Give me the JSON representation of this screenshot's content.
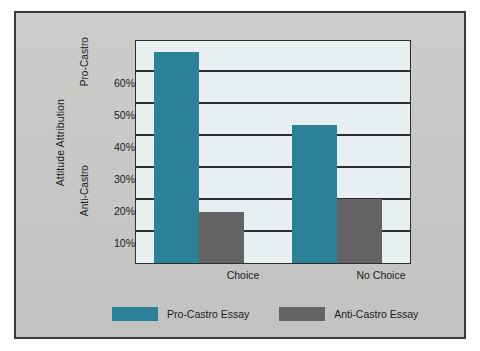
{
  "figure": {
    "background_color": "#c9c9c7",
    "border_color": "#3a3a3a"
  },
  "chart_data": {
    "type": "bar",
    "title": "",
    "subtitle": "",
    "xlabel": "",
    "ylabel": "Attitude Attribution",
    "categories": [
      "Choice",
      "No Choice"
    ],
    "series": [
      {
        "name": "Pro-Castro Essay",
        "color": "#2a8198",
        "values": [
          66,
          43
        ]
      },
      {
        "name": "Anti-Castro Essay",
        "color": "#636363",
        "values": [
          16,
          20
        ]
      }
    ],
    "ylim": [
      0,
      70
    ],
    "ytick_values": [
      10,
      20,
      30,
      40,
      50,
      60
    ],
    "ytick_labels": [
      "10%",
      "20%",
      "30%",
      "40%",
      "50%",
      "60%"
    ],
    "gridlines": [
      0,
      10,
      20,
      30,
      40,
      50,
      60,
      70
    ],
    "grid": true,
    "grid_color": "#2e2e2e",
    "plot_background": "#e7eff0",
    "legend_position": "bottom",
    "axis_pole_labels": {
      "top": "Pro-Castro",
      "bottom": "Anti-Castro"
    },
    "annotations": []
  }
}
